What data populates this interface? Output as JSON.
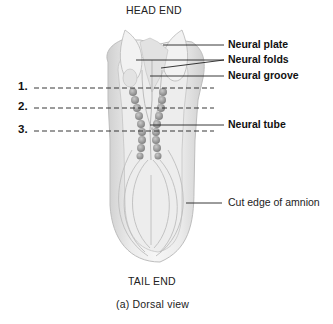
{
  "figure": {
    "top_label": "HEAD END",
    "bottom_label": "TAIL END",
    "caption": "(a) Dorsal view"
  },
  "labels": [
    {
      "id": "neural-plate",
      "text": "Neural plate"
    },
    {
      "id": "neural-folds",
      "text": "Neural folds"
    },
    {
      "id": "neural-groove",
      "text": "Neural groove"
    },
    {
      "id": "neural-tube",
      "text": "Neural tube"
    },
    {
      "id": "cut-edge-of-amnion",
      "text": "Cut edge of amnion"
    }
  ],
  "section_markers": [
    {
      "number": "1."
    },
    {
      "number": "2."
    },
    {
      "number": "3."
    }
  ],
  "colors": {
    "embryo_fill": "#e6e6e6",
    "embryo_shade": "#c8c8c8",
    "somite": "#9a9a9a",
    "leader_line": "#222222"
  }
}
